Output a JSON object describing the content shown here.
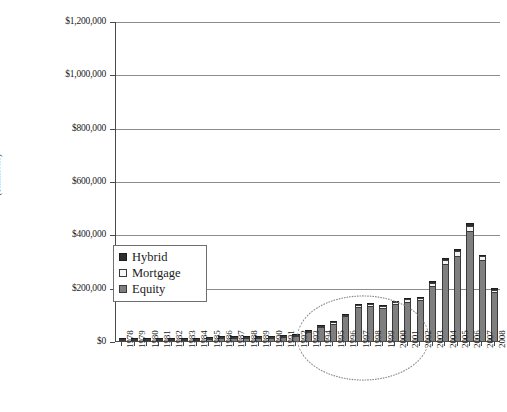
{
  "chart_data": {
    "type": "bar",
    "subtype": "stacked-vertical",
    "title": "",
    "xlabel": "",
    "ylabel": "($millions)",
    "ylim": [
      0,
      1200000
    ],
    "ytick_values": [
      0,
      200000,
      400000,
      600000,
      800000,
      1000000,
      1200000
    ],
    "ytick_labels": [
      "$0",
      "$200,000",
      "$400,000",
      "$600,000",
      "$800,000",
      "$1,000,000",
      "$1,200,000"
    ],
    "grid": true,
    "legend_position": "inside-left",
    "categories": [
      "1978",
      "1979",
      "1980",
      "1981",
      "1982",
      "1983",
      "1984",
      "1985",
      "1986",
      "1987",
      "1988",
      "1989",
      "1990",
      "1991",
      "1992",
      "1993",
      "1994",
      "1995",
      "1996",
      "1997",
      "1998",
      "1999",
      "2000",
      "2001",
      "2002",
      "2003",
      "2004",
      "2005",
      "2006",
      "2007",
      "2008"
    ],
    "series": [
      {
        "name": "Equity",
        "color": "#807f80",
        "values": [
          1200,
          1300,
          1400,
          1600,
          2600,
          3500,
          4200,
          7000,
          9500,
          11000,
          11500,
          12000,
          12500,
          13500,
          17000,
          33000,
          52000,
          65000,
          92000,
          128000,
          130000,
          122000,
          138000,
          148000,
          152000,
          208000,
          290000,
          320000,
          412000,
          302000,
          182000
        ]
      },
      {
        "name": "Mortgage",
        "color": "#f2f2f2",
        "values": [
          200,
          200,
          250,
          300,
          400,
          500,
          600,
          800,
          900,
          1000,
          1100,
          1200,
          1300,
          1400,
          1800,
          3000,
          4000,
          5000,
          6000,
          8000,
          8000,
          7500,
          8000,
          8500,
          9000,
          11000,
          14000,
          16000,
          20000,
          15000,
          11000
        ]
      },
      {
        "name": "Hybrid",
        "color": "#2e2e2e",
        "values": [
          100,
          100,
          150,
          200,
          300,
          400,
          500,
          700,
          800,
          900,
          900,
          1000,
          1100,
          1200,
          1500,
          2000,
          2500,
          3000,
          3500,
          4500,
          4500,
          4000,
          4500,
          5000,
          5000,
          6000,
          7000,
          8000,
          9000,
          7000,
          5000
        ]
      }
    ],
    "totals": [
      1500,
      1600,
      1800,
      2100,
      3300,
      4400,
      5300,
      8500,
      11200,
      12900,
      13500,
      14200,
      14900,
      16100,
      20300,
      38000,
      58500,
      73000,
      101500,
      140500,
      142500,
      133500,
      150500,
      161500,
      166000,
      225000,
      311000,
      344000,
      441000,
      324000,
      198000
    ],
    "annotations": [
      {
        "type": "ellipse",
        "style": "dotted",
        "covers": [
          "1993",
          "2002"
        ],
        "label": ""
      }
    ]
  },
  "legend": {
    "items": [
      {
        "label": "Hybrid",
        "swatch": "hybrid-swatch"
      },
      {
        "label": "Mortgage",
        "swatch": "mortgage-swatch"
      },
      {
        "label": "Equity",
        "swatch": "equity-swatch"
      }
    ]
  }
}
